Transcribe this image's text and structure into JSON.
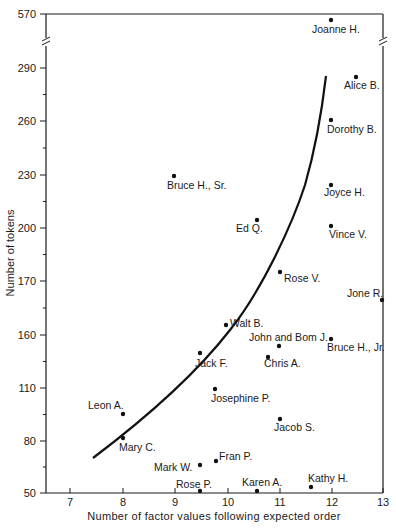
{
  "chart_data": {
    "type": "scatter",
    "title": "",
    "xlabel": "Number of factor values following expected order",
    "ylabel": "Number of tokens",
    "x_ticks": [
      7,
      8,
      9,
      10,
      11,
      12,
      13
    ],
    "y_ticks": [
      "50",
      "80",
      "110",
      "160",
      "170",
      "200",
      "230",
      "260",
      "290",
      "570"
    ],
    "y_axis_break": "between 290 and 570",
    "xlim": [
      6.55,
      13
    ],
    "grid": false,
    "legend": null,
    "points": [
      {
        "label": "Joanne H.",
        "x": 12.0,
        "y": 570
      },
      {
        "label": "Alice B.",
        "x": 12.5,
        "y": 285
      },
      {
        "label": "Dorothy B.",
        "x": 12.0,
        "y": 261
      },
      {
        "label": "Bruce H., Sr.",
        "x": 9.0,
        "y": 229
      },
      {
        "label": "Joyce H.",
        "x": 12.0,
        "y": 224
      },
      {
        "label": "Ed Q.",
        "x": 10.6,
        "y": 204
      },
      {
        "label": "Vince V.",
        "x": 12.0,
        "y": 201
      },
      {
        "label": "Rose V.",
        "x": 11.0,
        "y": 175
      },
      {
        "label": "Jone R.",
        "x": 13.0,
        "y": 179
      },
      {
        "label": "Walt B.",
        "x": 10.0,
        "y": 166
      },
      {
        "label": "John and Bom J.",
        "x": 11.0,
        "y": 154
      },
      {
        "label": "Bruce H., Jr.",
        "x": 12.0,
        "y": 157
      },
      {
        "label": "Jack F.",
        "x": 9.5,
        "y": 150
      },
      {
        "label": "Chris A.",
        "x": 10.8,
        "y": 148
      },
      {
        "label": "Josephine P.",
        "x": 9.8,
        "y": 109
      },
      {
        "label": "Leon A.",
        "x": 8.0,
        "y": 95
      },
      {
        "label": "Mary C.",
        "x": 8.0,
        "y": 81
      },
      {
        "label": "Jacob S.",
        "x": 11.0,
        "y": 92
      },
      {
        "label": "Mark W.",
        "x": 9.5,
        "y": 66
      },
      {
        "label": "Fran P.",
        "x": 9.8,
        "y": 68
      },
      {
        "label": "Rose P.",
        "x": 9.5,
        "y": 51
      },
      {
        "label": "Karen A.",
        "x": 10.6,
        "y": 51
      },
      {
        "label": "Kathy H.",
        "x": 11.6,
        "y": 53
      }
    ],
    "fitted_curve": {
      "description": "Increasing convex curve",
      "points": [
        [
          7.4,
          70
        ],
        [
          8.0,
          86
        ],
        [
          9.0,
          125
        ],
        [
          9.5,
          148
        ],
        [
          10.0,
          164
        ],
        [
          10.5,
          190
        ],
        [
          11.0,
          215
        ],
        [
          11.5,
          250
        ],
        [
          11.85,
          285
        ]
      ]
    }
  },
  "render": {
    "axis_labels": {
      "x": "Number of factor values following expected order",
      "y": "Number of tokens"
    },
    "x_ticks": [
      {
        "label": "7",
        "px": 70
      },
      {
        "label": "8",
        "px": 123
      },
      {
        "label": "9",
        "px": 175
      },
      {
        "label": "10",
        "px": 228
      },
      {
        "label": "11",
        "px": 280
      },
      {
        "label": "12",
        "px": 332
      },
      {
        "label": "13",
        "px": 383
      }
    ],
    "y_ticks": [
      {
        "label": "570",
        "py": 14
      },
      {
        "label": "290",
        "py": 68
      },
      {
        "label": "260",
        "py": 121
      },
      {
        "label": "230",
        "py": 175
      },
      {
        "label": "200",
        "py": 228
      },
      {
        "label": "170",
        "py": 281
      },
      {
        "label": "160",
        "py": 335
      },
      {
        "label": "110",
        "py": 388
      },
      {
        "label": "80",
        "py": 441
      },
      {
        "label": "50",
        "py": 493
      }
    ],
    "points": [
      {
        "label": "Joanne H.",
        "px": 331,
        "py": 20,
        "lx": 312,
        "ly": 33,
        "anchor": "start"
      },
      {
        "label": "Alice B.",
        "px": 356,
        "py": 77,
        "lx": 344,
        "ly": 89,
        "anchor": "start"
      },
      {
        "label": "Dorothy B.",
        "px": 331,
        "py": 120,
        "lx": 327,
        "ly": 133,
        "anchor": "start"
      },
      {
        "label": "Bruce H., Sr.",
        "px": 174,
        "py": 176,
        "lx": 167,
        "ly": 189,
        "anchor": "start"
      },
      {
        "label": "Joyce H.",
        "px": 331,
        "py": 185,
        "lx": 324,
        "ly": 196,
        "anchor": "start"
      },
      {
        "label": "Ed Q.",
        "px": 257,
        "py": 220,
        "lx": 236,
        "ly": 232,
        "anchor": "start"
      },
      {
        "label": "Vince V.",
        "px": 331,
        "py": 226,
        "lx": 329,
        "ly": 238,
        "anchor": "start"
      },
      {
        "label": "Rose V.",
        "px": 280,
        "py": 272,
        "lx": 284,
        "ly": 282,
        "anchor": "start"
      },
      {
        "label": "Jone R.",
        "px": 382,
        "py": 300,
        "lx": 347,
        "ly": 297,
        "anchor": "start"
      },
      {
        "label": "Walt B.",
        "px": 226,
        "py": 325,
        "lx": 230,
        "ly": 327,
        "anchor": "start"
      },
      {
        "label": "John and Bom J.",
        "px": 279,
        "py": 346,
        "lx": 249,
        "ly": 341,
        "anchor": "start"
      },
      {
        "label": "Bruce H., Jr.",
        "px": 331,
        "py": 339,
        "lx": 327,
        "ly": 351,
        "anchor": "start"
      },
      {
        "label": "Jack F.",
        "px": 200,
        "py": 353,
        "lx": 195,
        "ly": 367,
        "anchor": "start"
      },
      {
        "label": "Chris A.",
        "px": 268,
        "py": 357,
        "lx": 264,
        "ly": 367,
        "anchor": "start"
      },
      {
        "label": "Josephine P.",
        "px": 215,
        "py": 389,
        "lx": 211,
        "ly": 402,
        "anchor": "start"
      },
      {
        "label": "Leon A.",
        "px": 123,
        "py": 414,
        "lx": 88,
        "ly": 409,
        "anchor": "start"
      },
      {
        "label": "Mary C.",
        "px": 123,
        "py": 438,
        "lx": 119,
        "ly": 451,
        "anchor": "start"
      },
      {
        "label": "Jacob S.",
        "px": 280,
        "py": 419,
        "lx": 274,
        "ly": 431,
        "anchor": "start"
      },
      {
        "label": "Mark W.",
        "px": 200,
        "py": 465,
        "lx": 154,
        "ly": 471,
        "anchor": "start"
      },
      {
        "label": "Fran P.",
        "px": 216,
        "py": 461,
        "lx": 219,
        "ly": 460,
        "anchor": "start"
      },
      {
        "label": "Rose P.",
        "px": 200,
        "py": 491,
        "lx": 176,
        "ly": 488,
        "anchor": "start"
      },
      {
        "label": "Karen A.",
        "px": 257,
        "py": 491,
        "lx": 242,
        "ly": 486,
        "anchor": "start"
      },
      {
        "label": "Kathy H.",
        "px": 311,
        "py": 487,
        "lx": 308,
        "ly": 482,
        "anchor": "start"
      }
    ],
    "curve_path": "M 93 458 C 150 415, 195 375, 230 330 C 262 290, 292 225, 305 185 C 315 150, 322 110, 326 76"
  }
}
